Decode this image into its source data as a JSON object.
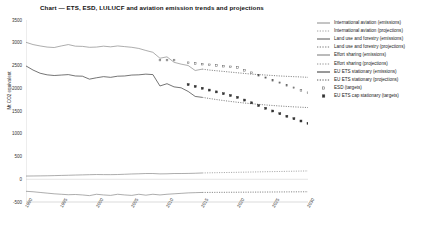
{
  "chart_data": {
    "type": "line",
    "title": "Chart — ETS, ESD, LULUCF and aviation emission trends and projections",
    "xlabel": "",
    "ylabel": "Mt CO2 equivalent",
    "ylim": [
      -500,
      3500
    ],
    "xlim": [
      1990,
      2030
    ],
    "yticks": [
      "3500",
      "3000",
      "2500",
      "2000",
      "1500",
      "1000",
      "500",
      "0",
      "-500"
    ],
    "ytick_values": [
      3500,
      3000,
      2500,
      2000,
      1500,
      1000,
      500,
      0,
      -500
    ],
    "xticks": [
      "1990",
      "1995",
      "2000",
      "2005",
      "2010",
      "2015",
      "2020",
      "2025",
      "2030"
    ],
    "xtick_values": [
      1990,
      1995,
      2000,
      2005,
      2010,
      2015,
      2020,
      2025,
      2030
    ],
    "grid": false,
    "legend_position": "right",
    "series": [
      {
        "name": "International aviation (emissions)",
        "style": "solid",
        "color": "#8a8a8a",
        "x": [
          1990,
          1991,
          1992,
          1993,
          1994,
          1995,
          1996,
          1997,
          1998,
          1999,
          2000,
          2001,
          2002,
          2003,
          2004,
          2005,
          2006,
          2007,
          2008,
          2009,
          2010,
          2011,
          2012,
          2013,
          2014,
          2015
        ],
        "values": [
          70,
          72,
          74,
          76,
          80,
          84,
          88,
          92,
          96,
          100,
          104,
          102,
          101,
          104,
          110,
          116,
          120,
          126,
          126,
          118,
          120,
          126,
          126,
          128,
          132,
          138
        ]
      },
      {
        "name": "International aviation (projections)",
        "style": "dotted",
        "color": "#8a8a8a",
        "x": [
          2015,
          2016,
          2017,
          2018,
          2019,
          2020,
          2021,
          2022,
          2023,
          2024,
          2025,
          2026,
          2027,
          2028,
          2029,
          2030
        ],
        "values": [
          138,
          141,
          144,
          147,
          150,
          153,
          156,
          159,
          162,
          165,
          168,
          171,
          174,
          177,
          180,
          183
        ]
      },
      {
        "name": "Land use and forestry (emissions)",
        "style": "solid",
        "color": "#8a8a8a",
        "x": [
          1990,
          1991,
          1992,
          1993,
          1994,
          1995,
          1996,
          1997,
          1998,
          1999,
          2000,
          2001,
          2002,
          2003,
          2004,
          2005,
          2006,
          2007,
          2008,
          2009,
          2010,
          2011,
          2012,
          2013,
          2014,
          2015
        ],
        "values": [
          -265,
          -275,
          -290,
          -305,
          -320,
          -330,
          -340,
          -335,
          -345,
          -360,
          -330,
          -345,
          -355,
          -330,
          -345,
          -355,
          -330,
          -350,
          -330,
          -345,
          -330,
          -320,
          -310,
          -300,
          -295,
          -290
        ]
      },
      {
        "name": "Land use and forestry (projections)",
        "style": "dotted",
        "color": "#5a5a5a",
        "x": [
          2015,
          2016,
          2017,
          2018,
          2019,
          2020,
          2021,
          2022,
          2023,
          2024,
          2025,
          2026,
          2027,
          2028,
          2029,
          2030
        ],
        "values": [
          -290,
          -289,
          -288,
          -287,
          -286,
          -285,
          -284,
          -283,
          -282,
          -281,
          -280,
          -279,
          -278,
          -277,
          -276,
          -275
        ]
      },
      {
        "name": "Effort sharing (emissions)",
        "style": "solid",
        "color": "#8a8a8a",
        "x": [
          1990,
          1991,
          1992,
          1993,
          1994,
          1995,
          1996,
          1997,
          1998,
          1999,
          2000,
          2001,
          2002,
          2003,
          2004,
          2005,
          2006,
          2007,
          2008,
          2009,
          2010,
          2011,
          2012,
          2013,
          2014,
          2015
        ],
        "values": [
          3010,
          2960,
          2930,
          2905,
          2895,
          2930,
          2960,
          2925,
          2920,
          2900,
          2905,
          2925,
          2910,
          2930,
          2915,
          2900,
          2875,
          2830,
          2790,
          2660,
          2690,
          2570,
          2530,
          2500,
          2390,
          2420
        ]
      },
      {
        "name": "Effort sharing (projections)",
        "style": "dotted",
        "color": "#5a5a5a",
        "x": [
          2015,
          2016,
          2017,
          2018,
          2019,
          2020,
          2021,
          2022,
          2023,
          2024,
          2025,
          2026,
          2027,
          2028,
          2029,
          2030
        ],
        "values": [
          2420,
          2400,
          2385,
          2370,
          2355,
          2340,
          2325,
          2310,
          2300,
          2290,
          2280,
          2270,
          2262,
          2255,
          2248,
          2240
        ]
      },
      {
        "name": "EU ETS stationary (emissions)",
        "style": "solid",
        "color": "#3a3a3a",
        "x": [
          1990,
          1991,
          1992,
          1993,
          1994,
          1995,
          1996,
          1997,
          1998,
          1999,
          2000,
          2001,
          2002,
          2003,
          2004,
          2005,
          2006,
          2007,
          2008,
          2009,
          2010,
          2011,
          2012,
          2013,
          2014,
          2015
        ],
        "values": [
          2490,
          2400,
          2330,
          2295,
          2280,
          2290,
          2300,
          2270,
          2265,
          2200,
          2230,
          2255,
          2240,
          2265,
          2270,
          2290,
          2295,
          2310,
          2300,
          2050,
          2100,
          2030,
          2010,
          1930,
          1820,
          1800
        ]
      },
      {
        "name": "EU ETS stationary (projections)",
        "style": "dotted",
        "color": "#5a5a5a",
        "x": [
          2015,
          2016,
          2017,
          2018,
          2019,
          2020,
          2021,
          2022,
          2023,
          2024,
          2025,
          2026,
          2027,
          2028,
          2029,
          2030
        ],
        "values": [
          1800,
          1775,
          1752,
          1730,
          1710,
          1692,
          1675,
          1660,
          1646,
          1633,
          1621,
          1610,
          1600,
          1591,
          1583,
          1576
        ]
      },
      {
        "name": "ESD (targets)",
        "style": "markers",
        "marker": "open-square",
        "color": "#555555",
        "x": [
          2009,
          2010,
          2011,
          2013,
          2014,
          2015,
          2016,
          2017,
          2018,
          2019,
          2020,
          2021,
          2022,
          2023,
          2024,
          2025,
          2026,
          2027,
          2028,
          2029,
          2030
        ],
        "values": [
          2620,
          2620,
          2620,
          2560,
          2545,
          2530,
          2515,
          2500,
          2485,
          2470,
          2455,
          2395,
          2340,
          2285,
          2230,
          2175,
          2120,
          2065,
          2010,
          1955,
          1900
        ]
      },
      {
        "name": "EU ETS cap stationary (targets)",
        "style": "markers",
        "marker": "filled-square",
        "color": "#333333",
        "x": [
          2013,
          2014,
          2015,
          2016,
          2017,
          2018,
          2019,
          2020,
          2021,
          2022,
          2023,
          2024,
          2025,
          2026,
          2027,
          2028,
          2029,
          2030
        ],
        "values": [
          2080,
          2040,
          2000,
          1960,
          1920,
          1880,
          1840,
          1800,
          1740,
          1680,
          1620,
          1560,
          1500,
          1440,
          1385,
          1330,
          1280,
          1230
        ]
      }
    ]
  },
  "legend": {
    "items": [
      {
        "label": "International aviation (emissions)",
        "sym": "solid",
        "color": "#8a8a8a"
      },
      {
        "label": "International aviation (projections)",
        "sym": "dotted",
        "color": "#8a8a8a"
      },
      {
        "label": "Land use and forestry (emissions)",
        "sym": "solid",
        "color": "#555555"
      },
      {
        "label": "Land use and forestry (projections)",
        "sym": "dotted",
        "color": "#555555"
      },
      {
        "label": "Effort sharing (emissions)",
        "sym": "solid",
        "color": "#777777"
      },
      {
        "label": "Effort sharing (projections)",
        "sym": "dotted",
        "color": "#777777"
      },
      {
        "label": "EU ETS stationary (emissions)",
        "sym": "solid",
        "color": "#333333"
      },
      {
        "label": "EU ETS stationary (projections)",
        "sym": "dotted",
        "color": "#333333"
      },
      {
        "label": "ESD (targets)",
        "sym": "open-square",
        "color": "#555555"
      },
      {
        "label": "EU ETS cap stationary (targets)",
        "sym": "filled-square",
        "color": "#333333"
      }
    ]
  }
}
